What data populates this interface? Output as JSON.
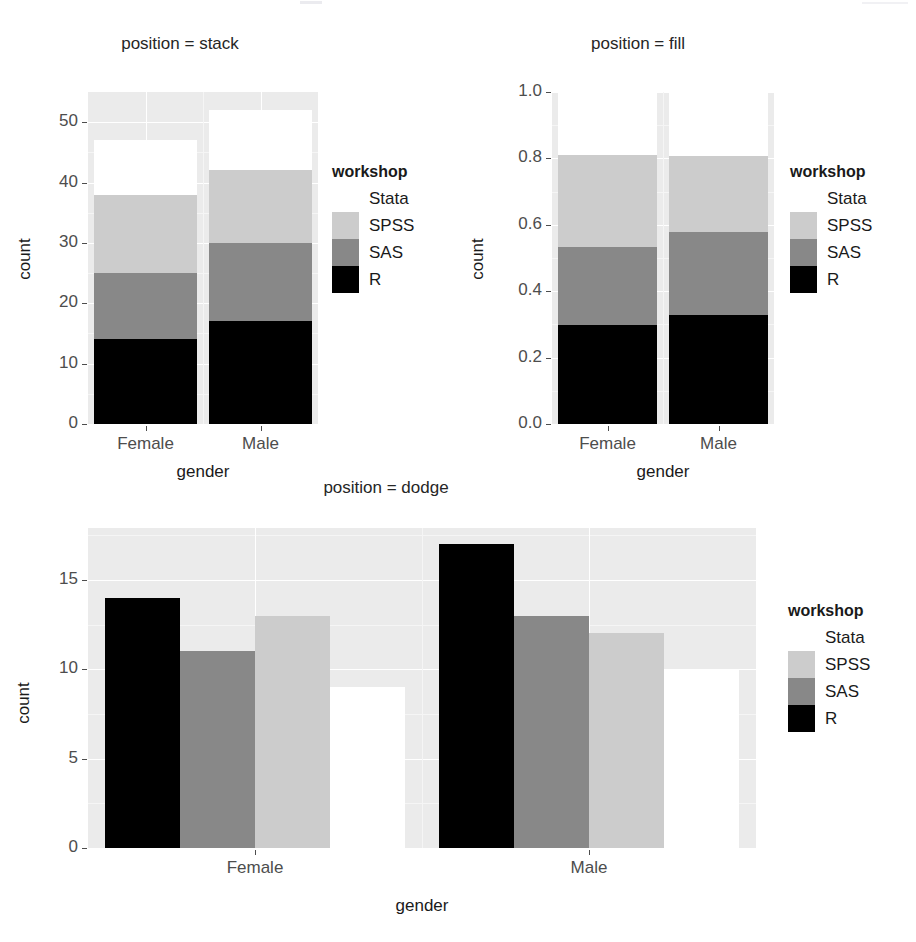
{
  "figure": {
    "colors": {
      "panel_bg": "#ebebeb",
      "grid_major": "#ffffff",
      "grid_minor": "#f5f5f5",
      "axis_text": "#4d4d4d",
      "title_text": "#262626"
    },
    "legend_title": "workshop",
    "fill_scale": [
      {
        "name": "Stata",
        "color": "#ffffff"
      },
      {
        "name": "SPSS",
        "color": "#cccccc"
      },
      {
        "name": "SAS",
        "color": "#888888"
      },
      {
        "name": "R",
        "color": "#000000"
      }
    ]
  },
  "chart_data": [
    {
      "type": "bar",
      "title": "position = stack",
      "subtitle": "",
      "xlabel": "gender",
      "ylabel": "count",
      "categories": [
        "Female",
        "Male"
      ],
      "stacking": "stack",
      "legend_title": "workshop",
      "legend_position": "right",
      "legend_order": [
        "Stata",
        "SPSS",
        "SAS",
        "R"
      ],
      "grid": true,
      "ylim": [
        0,
        55
      ],
      "yticks": [
        0,
        10,
        20,
        30,
        40,
        50
      ],
      "ytick_labels": [
        "0",
        "10",
        "20",
        "30",
        "40",
        "50"
      ],
      "series": [
        {
          "name": "R",
          "color": "#000000",
          "values": [
            14,
            17
          ]
        },
        {
          "name": "SAS",
          "color": "#888888",
          "values": [
            11,
            13
          ]
        },
        {
          "name": "SPSS",
          "color": "#cccccc",
          "values": [
            13,
            12
          ]
        },
        {
          "name": "Stata",
          "color": "#ffffff",
          "values": [
            9,
            10
          ]
        }
      ],
      "cumulative_tops": {
        "Female": {
          "R": 14,
          "SAS": 25,
          "SPSS": 38,
          "Stata": 47
        },
        "Male": {
          "R": 17,
          "SAS": 30,
          "SPSS": 42,
          "Stata": 52
        }
      }
    },
    {
      "type": "bar",
      "title": "position = fill",
      "subtitle": "",
      "xlabel": "gender",
      "ylabel": "count",
      "categories": [
        "Female",
        "Male"
      ],
      "stacking": "fill",
      "legend_title": "workshop",
      "legend_position": "right",
      "legend_order": [
        "Stata",
        "SPSS",
        "SAS",
        "R"
      ],
      "grid": true,
      "ylim": [
        0,
        1.0
      ],
      "yticks": [
        0.0,
        0.2,
        0.4,
        0.6,
        0.8,
        1.0
      ],
      "ytick_labels": [
        "0.0",
        "0.2",
        "0.4",
        "0.6",
        "0.8",
        "1.0"
      ],
      "series": [
        {
          "name": "R",
          "color": "#000000",
          "values": [
            0.298,
            0.327
          ]
        },
        {
          "name": "SAS",
          "color": "#888888",
          "values": [
            0.234,
            0.25
          ]
        },
        {
          "name": "SPSS",
          "color": "#cccccc",
          "values": [
            0.277,
            0.231
          ]
        },
        {
          "name": "Stata",
          "color": "#ffffff",
          "values": [
            0.191,
            0.192
          ]
        }
      ],
      "cumulative_tops": {
        "Female": {
          "R": 0.298,
          "SAS": 0.532,
          "SPSS": 0.809,
          "Stata": 1.0
        },
        "Male": {
          "R": 0.327,
          "SAS": 0.577,
          "SPSS": 0.808,
          "Stata": 1.0
        }
      }
    },
    {
      "type": "bar",
      "title": "position = dodge",
      "subtitle": "",
      "xlabel": "gender",
      "ylabel": "count",
      "categories": [
        "Female",
        "Male"
      ],
      "stacking": "dodge",
      "legend_title": "workshop",
      "legend_position": "right",
      "legend_order": [
        "Stata",
        "SPSS",
        "SAS",
        "R"
      ],
      "grid": true,
      "ylim": [
        0,
        17.9
      ],
      "yticks": [
        0,
        5,
        10,
        15
      ],
      "ytick_labels": [
        "0",
        "5",
        "10",
        "15"
      ],
      "series": [
        {
          "name": "R",
          "color": "#000000",
          "values": [
            14,
            17
          ]
        },
        {
          "name": "SAS",
          "color": "#888888",
          "values": [
            11,
            13
          ]
        },
        {
          "name": "SPSS",
          "color": "#cccccc",
          "values": [
            13,
            12
          ]
        },
        {
          "name": "Stata",
          "color": "#ffffff",
          "values": [
            9,
            10
          ]
        }
      ]
    }
  ]
}
